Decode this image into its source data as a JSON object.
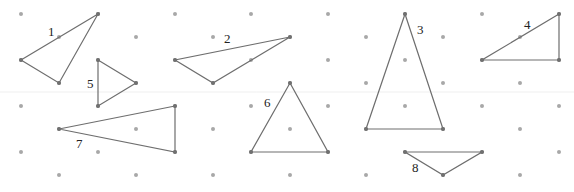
{
  "diagram": {
    "type": "isometric-dot-grid-triangles",
    "colors": {
      "background": "#ffffff",
      "dot": "#a8a8a8",
      "vertex": "#707070",
      "edge": "#6e6e6e",
      "label": "#222222",
      "fold_line": "#eeeeee"
    },
    "grid": {
      "row_y": [
        14,
        37,
        60,
        83,
        106,
        129,
        152,
        175
      ],
      "even_row_x": [
        21,
        98,
        175,
        251,
        328,
        405,
        482,
        559
      ],
      "odd_row_x": [
        59,
        136,
        213,
        290,
        366,
        443,
        520
      ]
    },
    "triangles": [
      {
        "label": "1",
        "points": [
          [
            98,
            14
          ],
          [
            21,
            60
          ],
          [
            59,
            83
          ]
        ],
        "label_pos": [
          48,
          36
        ]
      },
      {
        "label": "2",
        "points": [
          [
            290,
            37
          ],
          [
            175,
            60
          ],
          [
            213,
            83
          ]
        ],
        "label_pos": [
          224,
          43
        ]
      },
      {
        "label": "3",
        "points": [
          [
            405,
            14
          ],
          [
            366,
            129
          ],
          [
            443,
            129
          ]
        ],
        "label_pos": [
          417,
          34
        ]
      },
      {
        "label": "4",
        "points": [
          [
            559,
            14
          ],
          [
            482,
            60
          ],
          [
            559,
            60
          ]
        ],
        "label_pos": [
          524,
          29
        ]
      },
      {
        "label": "5",
        "points": [
          [
            98,
            60
          ],
          [
            136,
            83
          ],
          [
            98,
            106
          ]
        ],
        "label_pos": [
          87,
          88
        ]
      },
      {
        "label": "6",
        "points": [
          [
            290,
            83
          ],
          [
            251,
            152
          ],
          [
            328,
            152
          ]
        ],
        "label_pos": [
          264,
          107
        ]
      },
      {
        "label": "7",
        "points": [
          [
            175,
            106
          ],
          [
            59,
            129
          ],
          [
            175,
            152
          ]
        ],
        "label_pos": [
          76,
          148
        ]
      },
      {
        "label": "8",
        "points": [
          [
            405,
            152
          ],
          [
            482,
            152
          ],
          [
            443,
            175
          ]
        ],
        "label_pos": [
          412,
          172
        ]
      }
    ]
  }
}
